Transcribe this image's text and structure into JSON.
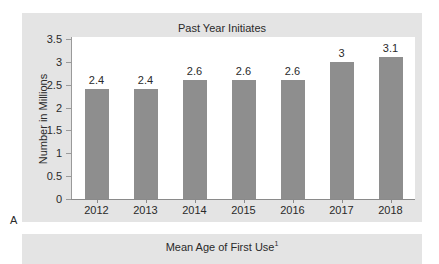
{
  "chart_data": {
    "type": "bar",
    "title": "Past Year Initiates",
    "xlabel": "",
    "ylabel": "Number in Millions",
    "categories": [
      "2012",
      "2013",
      "2014",
      "2015",
      "2016",
      "2017",
      "2018"
    ],
    "values": [
      2.4,
      2.4,
      2.6,
      2.6,
      2.6,
      3,
      3.1
    ],
    "data_labels": [
      "2.4",
      "2.4",
      "2.6",
      "2.6",
      "2.6",
      "3",
      "3.1"
    ],
    "ylim": [
      0,
      3.5
    ],
    "yticks": [
      "0",
      "0.5",
      "1",
      "1.5",
      "2",
      "2.5",
      "3",
      "3.5"
    ],
    "grid": false,
    "legend": null,
    "bar_color": "#8e8e8e"
  },
  "panel_label": "A",
  "next_panel": {
    "title": "Mean Age of First Use",
    "superscript": "1"
  }
}
